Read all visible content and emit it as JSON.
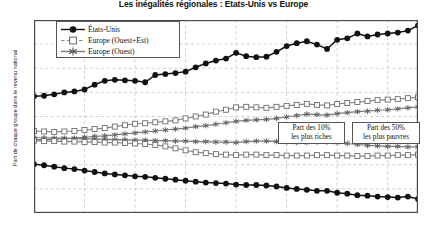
{
  "chart_data": {
    "type": "line",
    "title": "Les inégalités régionales : États-Unis vs Europe",
    "xlabel": "",
    "ylabel": "Part de chaque groupe dans le revenu national",
    "xlim": [
      1980,
      2018
    ],
    "ylim": [
      10,
      50
    ],
    "ytick_labels": [
      "10%",
      "15%",
      "20%",
      "25%",
      "30%",
      "35%",
      "40%",
      "45%",
      "50%"
    ],
    "ytick_values": [
      10,
      15,
      20,
      25,
      30,
      35,
      40,
      45,
      50
    ],
    "xtick_labels": [
      "1980",
      "1985",
      "1990",
      "1995",
      "2000",
      "2005",
      "2010",
      "2015"
    ],
    "xtick_values": [
      1980,
      1985,
      1990,
      1995,
      2000,
      2005,
      2010,
      2015
    ],
    "grid": true,
    "legend_position": "top-left",
    "x": [
      1980,
      1981,
      1982,
      1983,
      1984,
      1985,
      1986,
      1987,
      1988,
      1989,
      1990,
      1991,
      1992,
      1993,
      1994,
      1995,
      1996,
      1997,
      1998,
      1999,
      2000,
      2001,
      2002,
      2003,
      2004,
      2005,
      2006,
      2007,
      2008,
      2009,
      2010,
      2011,
      2012,
      2013,
      2014,
      2015,
      2016,
      2017,
      2018
    ],
    "annotations": [
      {
        "name": "part-des-10-les-plus-riches",
        "line1": "Part des 10%",
        "line2": "les plus riches"
      },
      {
        "name": "part-des-50-les-plus-pauvres",
        "line1": "Part des 50%",
        "line2": "les plus pauvres"
      }
    ],
    "series": [
      {
        "name": "États-Unis",
        "group": "top10",
        "marker": "filled-circle",
        "color": "#111111",
        "values": [
          34.2,
          34.3,
          34.6,
          35.0,
          35.2,
          35.6,
          36.6,
          37.4,
          37.6,
          37.5,
          37.4,
          37.1,
          38.6,
          38.8,
          39.0,
          39.3,
          40.2,
          41.0,
          41.6,
          42.0,
          43.2,
          42.5,
          42.3,
          42.4,
          43.4,
          44.6,
          45.2,
          45.6,
          44.9,
          44.0,
          45.9,
          46.2,
          47.2,
          46.6,
          47.0,
          47.2,
          47.4,
          47.8,
          48.9
        ]
      },
      {
        "name": "Europe (Ouest+Est)",
        "group": "top10",
        "marker": "open-square",
        "color": "#888888",
        "values": [
          27.0,
          26.9,
          26.8,
          26.9,
          27.0,
          27.2,
          27.4,
          27.6,
          27.9,
          28.2,
          28.5,
          28.6,
          28.8,
          29.0,
          29.2,
          29.6,
          30.0,
          30.4,
          31.0,
          31.4,
          31.9,
          32.0,
          31.9,
          31.8,
          32.0,
          32.2,
          32.4,
          32.6,
          32.4,
          32.3,
          32.6,
          32.8,
          33.0,
          33.2,
          33.4,
          33.5,
          33.6,
          33.8,
          34.0
        ]
      },
      {
        "name": "Europe (Ouest)",
        "group": "top10",
        "marker": "star",
        "color": "#7a7a7a",
        "values": [
          25.2,
          25.2,
          25.3,
          25.4,
          25.5,
          25.7,
          25.9,
          26.0,
          26.2,
          26.4,
          26.6,
          26.8,
          27.0,
          27.2,
          27.4,
          27.6,
          27.9,
          28.1,
          28.4,
          28.7,
          29.0,
          29.2,
          29.3,
          29.4,
          29.6,
          29.9,
          30.2,
          30.5,
          30.4,
          30.3,
          30.6,
          30.8,
          31.0,
          31.1,
          31.3,
          31.4,
          31.6,
          31.8,
          32.0
        ]
      },
      {
        "name": "Europe (Ouest)",
        "group": "bottom50",
        "marker": "star",
        "color": "#7a7a7a",
        "values": [
          25.6,
          25.6,
          25.5,
          25.5,
          25.4,
          25.4,
          25.3,
          25.3,
          25.2,
          25.2,
          25.1,
          25.1,
          25.0,
          25.0,
          24.9,
          24.9,
          24.8,
          24.8,
          24.7,
          24.7,
          24.6,
          24.8,
          24.9,
          24.9,
          24.8,
          24.7,
          24.6,
          24.6,
          24.7,
          24.7,
          24.6,
          24.4,
          24.2,
          24.0,
          23.9,
          23.8,
          23.8,
          23.7,
          23.7
        ]
      },
      {
        "name": "Europe (Ouest+Est)",
        "group": "bottom50",
        "marker": "open-square",
        "color": "#888888",
        "values": [
          25.0,
          24.9,
          24.9,
          24.8,
          24.8,
          24.7,
          24.7,
          24.6,
          24.6,
          24.5,
          24.4,
          24.3,
          24.1,
          23.8,
          23.4,
          23.0,
          22.6,
          22.4,
          22.2,
          22.1,
          22.0,
          22.1,
          22.1,
          22.0,
          22.0,
          21.9,
          21.9,
          21.9,
          22.0,
          22.0,
          21.9,
          21.9,
          21.8,
          21.8,
          21.9,
          21.9,
          22.0,
          22.0,
          22.1
        ]
      },
      {
        "name": "États-Unis",
        "group": "bottom50",
        "marker": "filled-circle",
        "color": "#111111",
        "values": [
          20.1,
          19.9,
          19.6,
          19.3,
          19.1,
          18.8,
          18.5,
          18.2,
          18.0,
          17.8,
          17.6,
          17.5,
          17.3,
          17.1,
          16.9,
          16.7,
          16.5,
          16.3,
          16.2,
          16.1,
          15.9,
          15.8,
          15.8,
          15.7,
          15.5,
          15.2,
          15.0,
          14.8,
          14.6,
          14.6,
          14.2,
          14.0,
          13.7,
          13.6,
          13.4,
          13.3,
          13.2,
          13.4,
          12.9
        ]
      }
    ]
  },
  "legend": {
    "items": [
      {
        "label": "États-Unis",
        "marker": "filled-circle"
      },
      {
        "label": "Europe (Ouest+Est)",
        "marker": "open-square"
      },
      {
        "label": "Europe (Ouest)",
        "marker": "star"
      }
    ]
  }
}
